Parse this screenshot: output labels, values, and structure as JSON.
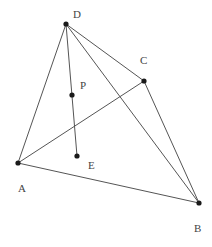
{
  "diagram": {
    "type": "geometry-figure",
    "colors": {
      "line": "#555555",
      "point": "#1a1a1a",
      "label": "#444444",
      "background": "#ffffff"
    },
    "points": [
      {
        "id": "D",
        "label": "D",
        "x": 66,
        "y": 24,
        "lx": 73,
        "ly": 18
      },
      {
        "id": "C",
        "label": "C",
        "x": 144,
        "y": 81,
        "lx": 140,
        "ly": 64
      },
      {
        "id": "P",
        "label": "P",
        "x": 72,
        "y": 95,
        "lx": 80,
        "ly": 89
      },
      {
        "id": "E",
        "label": "E",
        "x": 77,
        "y": 156,
        "lx": 88,
        "ly": 169
      },
      {
        "id": "A",
        "label": "A",
        "x": 18,
        "y": 163,
        "lx": 18,
        "ly": 192
      },
      {
        "id": "B",
        "label": "B",
        "x": 199,
        "y": 203,
        "lx": 194,
        "ly": 232
      }
    ],
    "segments": [
      {
        "name": "segment-DA",
        "from": "D",
        "to": "A"
      },
      {
        "name": "segment-DC",
        "from": "D",
        "to": "C"
      },
      {
        "name": "segment-DB",
        "from": "D",
        "to": "B"
      },
      {
        "name": "segment-DE",
        "from": "D",
        "to": "E"
      },
      {
        "name": "segment-AC",
        "from": "A",
        "to": "C"
      },
      {
        "name": "segment-AB",
        "from": "A",
        "to": "B"
      },
      {
        "name": "segment-CB",
        "from": "C",
        "to": "B"
      }
    ]
  }
}
